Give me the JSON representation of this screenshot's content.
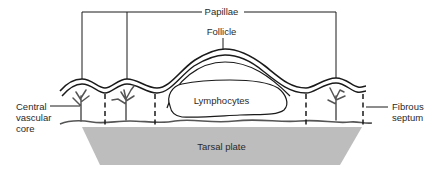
{
  "diagram": {
    "type": "anatomical-cross-section",
    "labels": {
      "papillae": "Papillae",
      "follicle": "Follicle",
      "lymphocytes": "Lymphocytes",
      "central_vascular_core": [
        "Central",
        "vascular",
        "core"
      ],
      "fibrous_septum": [
        "Fibrous",
        "septum"
      ],
      "tarsal_plate": "Tarsal plate"
    },
    "colors": {
      "line": "#1a1a1a",
      "vessel": "#555555",
      "tarsal_plate_fill": "#bdbdbd",
      "background": "#ffffff"
    }
  }
}
